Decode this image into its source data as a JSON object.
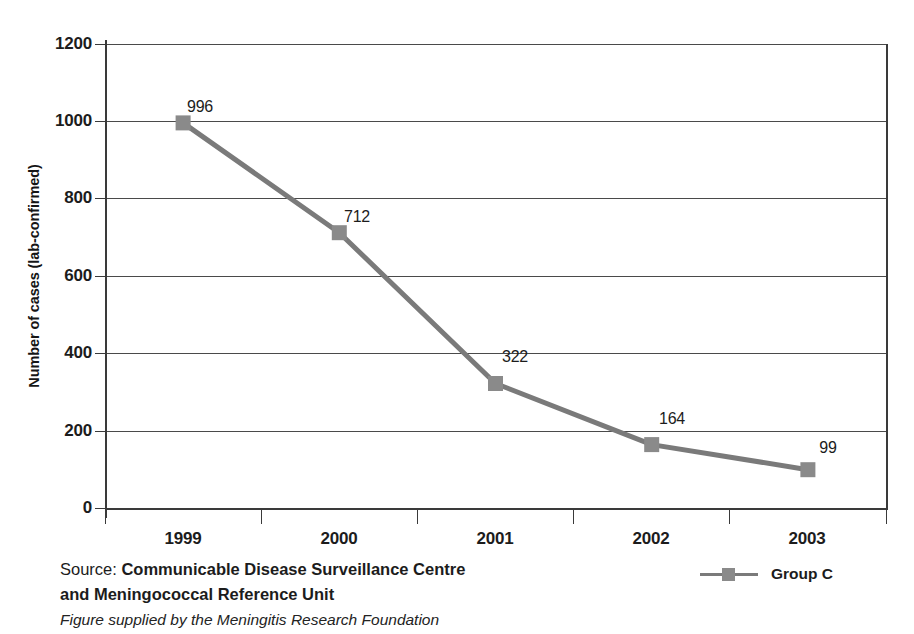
{
  "top_fragment": "",
  "chart_data": {
    "type": "line",
    "title": "",
    "xlabel": "",
    "ylabel": "Number of cases (lab-confirmed)",
    "categories": [
      "1999",
      "2000",
      "2001",
      "2002",
      "2003"
    ],
    "series": [
      {
        "name": "Group C",
        "values": [
          996,
          712,
          322,
          164,
          99
        ],
        "color": "#7a7a7a",
        "marker": "square",
        "marker_color": "#8a8a8a"
      }
    ],
    "yticks": [
      0,
      200,
      400,
      600,
      800,
      1000,
      1200
    ],
    "ytick_labels": [
      "0",
      "200",
      "400",
      "600",
      "800",
      "1000",
      "1200"
    ],
    "ylim": [
      0,
      1200
    ],
    "grid": "horizontal",
    "data_labels": [
      "996",
      "712",
      "322",
      "164",
      "99"
    ],
    "legend_position": "bottom-right",
    "axis_color": "#3a3a3a"
  },
  "legend": {
    "entries": [
      {
        "label": "Group C"
      }
    ]
  },
  "footer": {
    "source_lead": "Source: ",
    "source_strong_line1": "Communicable Disease Surveillance Centre",
    "source_strong_line2": "and Meningococcal Reference Unit",
    "source_italic": "Figure supplied by the Meningitis Research Foundation"
  }
}
